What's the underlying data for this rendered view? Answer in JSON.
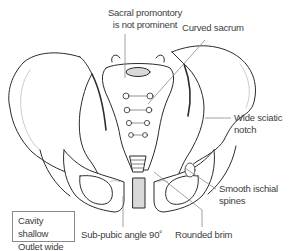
{
  "diagram": {
    "labels": {
      "sacral_promontory": [
        "Sacral promontory",
        "is not prominent"
      ],
      "curved_sacrum": "Curved sacrum",
      "wide_sciatic_notch": [
        "Wide sciatic",
        "notch"
      ],
      "smooth_ischial_spines": [
        "Smooth ischial",
        "spines"
      ],
      "rounded_brim": "Rounded brim",
      "sub_pubic_angle": "Sub-pubic angle 90˚"
    },
    "summary_box": [
      "Cavity shallow",
      "Outlet wide"
    ],
    "colors": {
      "outline": "#2b2b2b",
      "leader_line": "#8a8a8a",
      "text": "#3d3d3d",
      "fill": "#ffffff",
      "shading": "#d9d9d9"
    }
  }
}
